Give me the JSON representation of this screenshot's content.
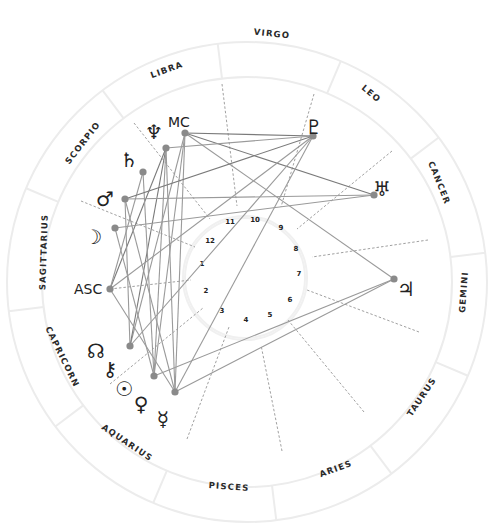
{
  "chart": {
    "center": [
      247,
      282
    ],
    "radii": {
      "outer": 240,
      "zodiac_inner": 205,
      "house_outer": 100,
      "house_inner": 80
    },
    "colors": {
      "ring": "#ececec",
      "aspect_line": "#9a9a9a",
      "aspect_line_dark": "#7a7a7a",
      "point": "#8a8a8a",
      "cusp": "#888888",
      "text": "#222222"
    },
    "signs": [
      {
        "name": "VIRGO",
        "x": 272,
        "y": 34,
        "rot": 6
      },
      {
        "name": "LEO",
        "x": 371,
        "y": 94,
        "rot": 40
      },
      {
        "name": "CANCER",
        "x": 439,
        "y": 183,
        "rot": 68
      },
      {
        "name": "GEMINI",
        "x": 464,
        "y": 292,
        "rot": -86
      },
      {
        "name": "TAURUS",
        "x": 422,
        "y": 397,
        "rot": -56
      },
      {
        "name": "ARIES",
        "x": 336,
        "y": 469,
        "rot": -20
      },
      {
        "name": "PISCES",
        "x": 229,
        "y": 487,
        "rot": 4
      },
      {
        "name": "AQUARIUS",
        "x": 127,
        "y": 443,
        "rot": 34
      },
      {
        "name": "CAPRICORN",
        "x": 62,
        "y": 357,
        "rot": 64
      },
      {
        "name": "SAGITTARIUS",
        "x": 44,
        "y": 252,
        "rot": -88
      },
      {
        "name": "SCORPIO",
        "x": 83,
        "y": 143,
        "rot": -52
      },
      {
        "name": "LIBRA",
        "x": 167,
        "y": 70,
        "rot": -20
      }
    ],
    "sign_dividers_deg": [
      97,
      127,
      157,
      187,
      217,
      247,
      277,
      307,
      337,
      7,
      37,
      67
    ],
    "houses": [
      {
        "num": "1",
        "x": 202,
        "y": 264
      },
      {
        "num": "2",
        "x": 206,
        "y": 291
      },
      {
        "num": "3",
        "x": 222,
        "y": 311
      },
      {
        "num": "4",
        "x": 246,
        "y": 320
      },
      {
        "num": "5",
        "x": 270,
        "y": 315
      },
      {
        "num": "6",
        "x": 290,
        "y": 300
      },
      {
        "num": "7",
        "x": 299,
        "y": 274
      },
      {
        "num": "8",
        "x": 296,
        "y": 249
      },
      {
        "num": "9",
        "x": 281,
        "y": 228
      },
      {
        "num": "10",
        "x": 255,
        "y": 220
      },
      {
        "name": "11",
        "num": "11",
        "x": 230,
        "y": 222
      },
      {
        "num": "12",
        "x": 210,
        "y": 241
      }
    ],
    "cusps": [
      {
        "x1": 110,
        "y1": 289,
        "x2": 191,
        "y2": 280
      },
      {
        "x1": 110,
        "y1": 384,
        "x2": 203,
        "y2": 308
      },
      {
        "x1": 187,
        "y1": 439,
        "x2": 229,
        "y2": 327
      },
      {
        "x1": 282,
        "y1": 451,
        "x2": 261,
        "y2": 345
      },
      {
        "x1": 364,
        "y1": 412,
        "x2": 288,
        "y2": 320
      },
      {
        "x1": 419,
        "y1": 332,
        "x2": 307,
        "y2": 290
      },
      {
        "x1": 428,
        "y1": 240,
        "x2": 312,
        "y2": 257
      },
      {
        "x1": 392,
        "y1": 151,
        "x2": 297,
        "y2": 229
      },
      {
        "x1": 314,
        "y1": 94,
        "x2": 281,
        "y2": 207
      },
      {
        "x1": 222,
        "y1": 84,
        "x2": 237,
        "y2": 206
      },
      {
        "x1": 134,
        "y1": 123,
        "x2": 210,
        "y2": 219
      },
      {
        "x1": 81,
        "y1": 201,
        "x2": 195,
        "y2": 247
      }
    ],
    "points": [
      {
        "id": "mc",
        "label": "MC",
        "glyph": "",
        "x": 185,
        "y": 133,
        "lx": 167,
        "ly": 126,
        "is_text": true
      },
      {
        "id": "neptune",
        "label": "Neptune",
        "glyph": "♆",
        "x": 166,
        "y": 148,
        "lx": 154,
        "ly": 133
      },
      {
        "id": "saturn",
        "label": "Saturn",
        "glyph": "♄",
        "x": 143,
        "y": 172,
        "lx": 129,
        "ly": 161
      },
      {
        "id": "mars",
        "label": "Mars",
        "glyph": "♂",
        "x": 125,
        "y": 199,
        "lx": 105,
        "ly": 200
      },
      {
        "id": "moon",
        "label": "Moon",
        "glyph": "☽",
        "x": 115,
        "y": 228,
        "lx": 93,
        "ly": 238
      },
      {
        "id": "asc",
        "label": "ASC",
        "glyph": "",
        "x": 110,
        "y": 289,
        "lx": 74,
        "ly": 294,
        "is_text": true
      },
      {
        "id": "north-node",
        "label": "North Node",
        "glyph": "☊",
        "x": 130,
        "y": 346,
        "lx": 96,
        "ly": 352
      },
      {
        "id": "chiron",
        "label": "Chiron",
        "glyph": "⚷",
        "x": 0,
        "y": 0,
        "lx": 110,
        "ly": 370,
        "no_dot": true
      },
      {
        "id": "sun",
        "label": "Sun",
        "glyph": "☉",
        "x": 154,
        "y": 376,
        "lx": 124,
        "ly": 390
      },
      {
        "id": "venus",
        "label": "Venus",
        "glyph": "♀",
        "x": 175,
        "y": 392,
        "lx": 141,
        "ly": 405
      },
      {
        "id": "mercury",
        "label": "Mercury",
        "glyph": "☿",
        "x": 175,
        "y": 392,
        "lx": 163,
        "ly": 420,
        "no_dot": true
      },
      {
        "id": "pluto",
        "label": "Pluto",
        "glyph": "♇",
        "x": 313,
        "y": 136,
        "lx": 314,
        "ly": 128
      },
      {
        "id": "uranus",
        "label": "Uranus",
        "glyph": "♅",
        "x": 374,
        "y": 195,
        "lx": 382,
        "ly": 190
      },
      {
        "id": "jupiter",
        "label": "Jupiter",
        "glyph": "♃",
        "x": 394,
        "y": 279,
        "lx": 406,
        "ly": 290
      }
    ],
    "aspects": [
      {
        "x1": 185,
        "y1": 133,
        "x2": 313,
        "y2": 136,
        "dark": true
      },
      {
        "x1": 185,
        "y1": 133,
        "x2": 374,
        "y2": 195,
        "dark": true
      },
      {
        "x1": 185,
        "y1": 133,
        "x2": 394,
        "y2": 279
      },
      {
        "x1": 185,
        "y1": 133,
        "x2": 130,
        "y2": 346
      },
      {
        "x1": 185,
        "y1": 133,
        "x2": 154,
        "y2": 376
      },
      {
        "x1": 185,
        "y1": 133,
        "x2": 175,
        "y2": 392
      },
      {
        "x1": 166,
        "y1": 148,
        "x2": 313,
        "y2": 136
      },
      {
        "x1": 166,
        "y1": 148,
        "x2": 130,
        "y2": 346,
        "dark": true
      },
      {
        "x1": 166,
        "y1": 148,
        "x2": 110,
        "y2": 289,
        "dark": true
      },
      {
        "x1": 166,
        "y1": 148,
        "x2": 175,
        "y2": 392
      },
      {
        "x1": 166,
        "y1": 148,
        "x2": 154,
        "y2": 376
      },
      {
        "x1": 143,
        "y1": 172,
        "x2": 110,
        "y2": 289
      },
      {
        "x1": 143,
        "y1": 172,
        "x2": 154,
        "y2": 376
      },
      {
        "x1": 125,
        "y1": 199,
        "x2": 313,
        "y2": 136,
        "dark": true
      },
      {
        "x1": 125,
        "y1": 199,
        "x2": 374,
        "y2": 195
      },
      {
        "x1": 125,
        "y1": 199,
        "x2": 175,
        "y2": 392
      },
      {
        "x1": 125,
        "y1": 199,
        "x2": 130,
        "y2": 346
      },
      {
        "x1": 115,
        "y1": 228,
        "x2": 374,
        "y2": 195
      },
      {
        "x1": 115,
        "y1": 228,
        "x2": 154,
        "y2": 376
      },
      {
        "x1": 110,
        "y1": 289,
        "x2": 313,
        "y2": 136
      },
      {
        "x1": 110,
        "y1": 289,
        "x2": 175,
        "y2": 392
      },
      {
        "x1": 130,
        "y1": 346,
        "x2": 313,
        "y2": 136
      },
      {
        "x1": 154,
        "y1": 376,
        "x2": 394,
        "y2": 279
      },
      {
        "x1": 175,
        "y1": 392,
        "x2": 394,
        "y2": 279
      },
      {
        "x1": 175,
        "y1": 392,
        "x2": 313,
        "y2": 136
      }
    ]
  }
}
